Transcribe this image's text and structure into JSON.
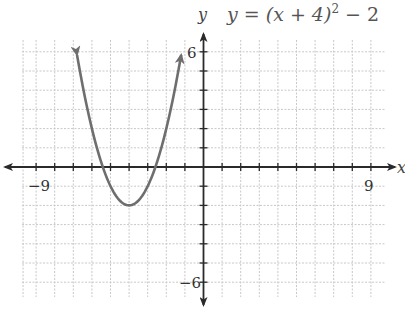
{
  "chart_data": {
    "type": "line",
    "equation": {
      "prefix": "y = (x + 4)",
      "exponent": "2",
      "suffix": " − 2"
    },
    "xlabel": "x",
    "ylabel": "y",
    "xlim": [
      -9,
      9
    ],
    "ylim": [
      -6,
      6
    ],
    "grid": true,
    "tick_labels": {
      "x_min": "−9",
      "x_max": "9",
      "y_max": "6",
      "y_min": "−6"
    },
    "series": [
      {
        "name": "y = (x + 4)^2 - 2",
        "vertex": [
          -4,
          -2
        ],
        "x": [
          -6.8,
          -6,
          -5,
          -4,
          -3,
          -2,
          -1.2
        ],
        "y": [
          5.84,
          2,
          -1,
          -2,
          -1,
          2,
          5.84
        ],
        "arrows_at_ends": true
      }
    ],
    "colors": {
      "curve": "#6e6e6e",
      "axis": "#2a2a2a",
      "grid": "#c8c8c8"
    }
  }
}
